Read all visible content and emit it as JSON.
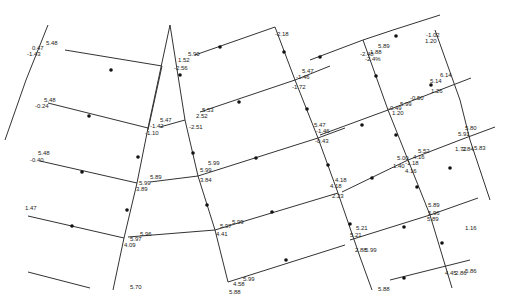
{
  "diagram": {
    "type": "pipe-network",
    "colors": {
      "line": "#333333",
      "node": "#111111",
      "background": "#ffffff"
    },
    "pipes": [
      {
        "id": "p1",
        "x1": 48,
        "y1": 25,
        "x2": 26,
        "y2": 80
      },
      {
        "id": "p2",
        "x1": 26,
        "y1": 80,
        "x2": 5,
        "y2": 140
      },
      {
        "id": "p3",
        "x1": 65,
        "y1": 50,
        "x2": 162,
        "y2": 66
      },
      {
        "id": "p4",
        "x1": 162,
        "y1": 66,
        "x2": 148,
        "y2": 130
      },
      {
        "id": "p5",
        "x1": 48,
        "y1": 103,
        "x2": 148,
        "y2": 128
      },
      {
        "id": "p6",
        "x1": 40,
        "y1": 161,
        "x2": 137,
        "y2": 183
      },
      {
        "id": "p7",
        "x1": 170,
        "y1": 25,
        "x2": 148,
        "y2": 128
      },
      {
        "id": "p8",
        "x1": 148,
        "y1": 128,
        "x2": 137,
        "y2": 183
      },
      {
        "id": "p9",
        "x1": 137,
        "y1": 183,
        "x2": 124,
        "y2": 238
      },
      {
        "id": "p10",
        "x1": 124,
        "y1": 238,
        "x2": 113,
        "y2": 290
      },
      {
        "id": "p11",
        "x1": 28,
        "y1": 216,
        "x2": 124,
        "y2": 238
      },
      {
        "id": "p12",
        "x1": 28,
        "y1": 272,
        "x2": 90,
        "y2": 288
      },
      {
        "id": "p13",
        "x1": 195,
        "y1": 55,
        "x2": 275,
        "y2": 27
      },
      {
        "id": "p14",
        "x1": 275,
        "y1": 27,
        "x2": 295,
        "y2": 80
      },
      {
        "id": "p15",
        "x1": 295,
        "y1": 80,
        "x2": 318,
        "y2": 138
      },
      {
        "id": "p16",
        "x1": 318,
        "y1": 138,
        "x2": 338,
        "y2": 193
      },
      {
        "id": "p17",
        "x1": 338,
        "y1": 193,
        "x2": 360,
        "y2": 257
      },
      {
        "id": "p18",
        "x1": 360,
        "y1": 257,
        "x2": 372,
        "y2": 290
      },
      {
        "id": "p19",
        "x1": 170,
        "y1": 25,
        "x2": 185,
        "y2": 120
      },
      {
        "id": "p20",
        "x1": 185,
        "y1": 120,
        "x2": 198,
        "y2": 176
      },
      {
        "id": "p21",
        "x1": 198,
        "y1": 176,
        "x2": 215,
        "y2": 230
      },
      {
        "id": "p22",
        "x1": 215,
        "y1": 230,
        "x2": 228,
        "y2": 282
      },
      {
        "id": "p23",
        "x1": 160,
        "y1": 127,
        "x2": 185,
        "y2": 120
      },
      {
        "id": "p24",
        "x1": 200,
        "y1": 112,
        "x2": 295,
        "y2": 80
      },
      {
        "id": "p25",
        "x1": 295,
        "y1": 80,
        "x2": 330,
        "y2": 66
      },
      {
        "id": "p26",
        "x1": 150,
        "y1": 182,
        "x2": 198,
        "y2": 176
      },
      {
        "id": "p27",
        "x1": 198,
        "y1": 176,
        "x2": 318,
        "y2": 138
      },
      {
        "id": "p28",
        "x1": 318,
        "y1": 138,
        "x2": 345,
        "y2": 128
      },
      {
        "id": "p29",
        "x1": 128,
        "y1": 237,
        "x2": 215,
        "y2": 230
      },
      {
        "id": "p30",
        "x1": 215,
        "y1": 230,
        "x2": 338,
        "y2": 193
      },
      {
        "id": "p31",
        "x1": 228,
        "y1": 282,
        "x2": 345,
        "y2": 245
      },
      {
        "id": "p32",
        "x1": 310,
        "y1": 60,
        "x2": 363,
        "y2": 40
      },
      {
        "id": "p33",
        "x1": 363,
        "y1": 40,
        "x2": 393,
        "y2": 30
      },
      {
        "id": "p34",
        "x1": 393,
        "y1": 30,
        "x2": 440,
        "y2": 15
      },
      {
        "id": "p35",
        "x1": 363,
        "y1": 40,
        "x2": 388,
        "y2": 110
      },
      {
        "id": "p36",
        "x1": 388,
        "y1": 110,
        "x2": 408,
        "y2": 160
      },
      {
        "id": "p37",
        "x1": 408,
        "y1": 160,
        "x2": 430,
        "y2": 215
      },
      {
        "id": "p38",
        "x1": 430,
        "y1": 215,
        "x2": 452,
        "y2": 288
      },
      {
        "id": "p39",
        "x1": 320,
        "y1": 135,
        "x2": 388,
        "y2": 110
      },
      {
        "id": "p40",
        "x1": 388,
        "y1": 110,
        "x2": 471,
        "y2": 78
      },
      {
        "id": "p41",
        "x1": 342,
        "y1": 192,
        "x2": 408,
        "y2": 160
      },
      {
        "id": "p42",
        "x1": 408,
        "y1": 160,
        "x2": 460,
        "y2": 140
      },
      {
        "id": "p43",
        "x1": 460,
        "y1": 140,
        "x2": 495,
        "y2": 127
      },
      {
        "id": "p44",
        "x1": 350,
        "y1": 240,
        "x2": 430,
        "y2": 215
      },
      {
        "id": "p45",
        "x1": 430,
        "y1": 215,
        "x2": 478,
        "y2": 198
      },
      {
        "id": "p46",
        "x1": 435,
        "y1": 30,
        "x2": 460,
        "y2": 100
      },
      {
        "id": "p47",
        "x1": 460,
        "y1": 100,
        "x2": 470,
        "y2": 140
      },
      {
        "id": "p48",
        "x1": 470,
        "y1": 140,
        "x2": 490,
        "y2": 200
      },
      {
        "id": "p49",
        "x1": 390,
        "y1": 280,
        "x2": 438,
        "y2": 268
      },
      {
        "id": "p50",
        "x1": 438,
        "y1": 268,
        "x2": 470,
        "y2": 260
      }
    ],
    "labels": [
      {
        "x": 46,
        "y": 40,
        "text": "5.48"
      },
      {
        "x": 32,
        "y": 45,
        "text": "0.47"
      },
      {
        "x": 27,
        "y": 51,
        "text": "-1.43"
      },
      {
        "x": 44,
        "y": 97,
        "text": "5.48"
      },
      {
        "x": 35,
        "y": 103,
        "text": "-0.24"
      },
      {
        "x": 160,
        "y": 117,
        "text": "5.47"
      },
      {
        "x": 150,
        "y": 123,
        "text": "-1.42"
      },
      {
        "x": 145,
        "y": 130,
        "text": "-1.10"
      },
      {
        "x": 38,
        "y": 150,
        "text": "5.48"
      },
      {
        "x": 30,
        "y": 157,
        "text": "-0.40"
      },
      {
        "x": 150,
        "y": 174,
        "text": "5.89"
      },
      {
        "x": 139,
        "y": 180,
        "text": "5.99"
      },
      {
        "x": 136,
        "y": 186,
        "text": "3.89"
      },
      {
        "x": 25,
        "y": 205,
        "text": "1.47"
      },
      {
        "x": 140,
        "y": 231,
        "text": "5.96"
      },
      {
        "x": 130,
        "y": 236,
        "text": "5.97"
      },
      {
        "x": 124,
        "y": 242,
        "text": "4.09"
      },
      {
        "x": 130,
        "y": 284,
        "text": "5.70"
      },
      {
        "x": 188,
        "y": 51,
        "text": "5.90"
      },
      {
        "x": 178,
        "y": 57,
        "text": "1.52"
      },
      {
        "x": 174,
        "y": 65,
        "text": "-2.56"
      },
      {
        "x": 275,
        "y": 31,
        "text": "-2.18"
      },
      {
        "x": 302,
        "y": 68,
        "text": "5.47"
      },
      {
        "x": 296,
        "y": 74,
        "text": "-1.46"
      },
      {
        "x": 292,
        "y": 84,
        "text": "-1.72"
      },
      {
        "x": 202,
        "y": 107,
        "text": "5.53"
      },
      {
        "x": 196,
        "y": 113,
        "text": "2.52"
      },
      {
        "x": 189,
        "y": 124,
        "text": "-2.51"
      },
      {
        "x": 314,
        "y": 122,
        "text": "5.47"
      },
      {
        "x": 316,
        "y": 128,
        "text": "-1.46"
      },
      {
        "x": 315,
        "y": 138,
        "text": "-0.43"
      },
      {
        "x": 208,
        "y": 160,
        "text": "5.99"
      },
      {
        "x": 200,
        "y": 167,
        "text": "5.99"
      },
      {
        "x": 200,
        "y": 177,
        "text": "3.84"
      },
      {
        "x": 335,
        "y": 177,
        "text": "4.18"
      },
      {
        "x": 330,
        "y": 183,
        "text": "4.18"
      },
      {
        "x": 332,
        "y": 193,
        "text": "2.23"
      },
      {
        "x": 232,
        "y": 219,
        "text": "5.99"
      },
      {
        "x": 220,
        "y": 223,
        "text": "5.97"
      },
      {
        "x": 216,
        "y": 231,
        "text": "4.41"
      },
      {
        "x": 243,
        "y": 276,
        "text": "5.99"
      },
      {
        "x": 233,
        "y": 281,
        "text": "4.58"
      },
      {
        "x": 229,
        "y": 289,
        "text": "5.88"
      },
      {
        "x": 378,
        "y": 43,
        "text": "5.89"
      },
      {
        "x": 370,
        "y": 49,
        "text": "1.88"
      },
      {
        "x": 360,
        "y": 51,
        "text": "-2.48"
      },
      {
        "x": 365,
        "y": 56,
        "text": "-2.4%"
      },
      {
        "x": 426,
        "y": 32,
        "text": "-1.02"
      },
      {
        "x": 425,
        "y": 38,
        "text": "1.20"
      },
      {
        "x": 440,
        "y": 72,
        "text": "6.14"
      },
      {
        "x": 430,
        "y": 78,
        "text": "5.14"
      },
      {
        "x": 431,
        "y": 88,
        "text": "1.26"
      },
      {
        "x": 410,
        "y": 95,
        "text": "-0.50"
      },
      {
        "x": 400,
        "y": 101,
        "text": "5.99"
      },
      {
        "x": 388,
        "y": 105,
        "text": "-0.49"
      },
      {
        "x": 392,
        "y": 110,
        "text": "1.20"
      },
      {
        "x": 465,
        "y": 125,
        "text": "5.80"
      },
      {
        "x": 458,
        "y": 131,
        "text": "5.91"
      },
      {
        "x": 474,
        "y": 145,
        "text": "5.83"
      },
      {
        "x": 455,
        "y": 146,
        "text": "1.72"
      },
      {
        "x": 462,
        "y": 146,
        "text": "2.84"
      },
      {
        "x": 418,
        "y": 148,
        "text": "5.52"
      },
      {
        "x": 413,
        "y": 154,
        "text": "4.16"
      },
      {
        "x": 397,
        "y": 155,
        "text": "5.00"
      },
      {
        "x": 393,
        "y": 163,
        "text": "1.40"
      },
      {
        "x": 405,
        "y": 160,
        "text": "-1.18"
      },
      {
        "x": 405,
        "y": 168,
        "text": "4.16"
      },
      {
        "x": 356,
        "y": 225,
        "text": "5.21"
      },
      {
        "x": 350,
        "y": 232,
        "text": "5.21"
      },
      {
        "x": 355,
        "y": 247,
        "text": "2.88"
      },
      {
        "x": 365,
        "y": 247,
        "text": "5.99"
      },
      {
        "x": 428,
        "y": 202,
        "text": "5.89"
      },
      {
        "x": 428,
        "y": 210,
        "text": "5.96"
      },
      {
        "x": 427,
        "y": 216,
        "text": "5.89"
      },
      {
        "x": 465,
        "y": 225,
        "text": "1.16"
      },
      {
        "x": 465,
        "y": 268,
        "text": "5.86"
      },
      {
        "x": 445,
        "y": 270,
        "text": "4.45"
      },
      {
        "x": 455,
        "y": 270,
        "text": "2.86"
      },
      {
        "x": 378,
        "y": 286,
        "text": "5.88"
      }
    ],
    "flow_arrows": [
      {
        "x": 111,
        "y": 70
      },
      {
        "x": 320,
        "y": 57
      },
      {
        "x": 89,
        "y": 116
      },
      {
        "x": 82,
        "y": 172
      },
      {
        "x": 72,
        "y": 226
      },
      {
        "x": 138,
        "y": 157
      },
      {
        "x": 127,
        "y": 210
      },
      {
        "x": 220,
        "y": 47
      },
      {
        "x": 284,
        "y": 52
      },
      {
        "x": 180,
        "y": 75
      },
      {
        "x": 193,
        "y": 153
      },
      {
        "x": 207,
        "y": 205
      },
      {
        "x": 239,
        "y": 102
      },
      {
        "x": 256,
        "y": 158
      },
      {
        "x": 272,
        "y": 212
      },
      {
        "x": 286,
        "y": 260
      },
      {
        "x": 307,
        "y": 109
      },
      {
        "x": 328,
        "y": 165
      },
      {
        "x": 350,
        "y": 224
      },
      {
        "x": 396,
        "y": 36
      },
      {
        "x": 376,
        "y": 76
      },
      {
        "x": 396,
        "y": 135
      },
      {
        "x": 417,
        "y": 187
      },
      {
        "x": 442,
        "y": 243
      },
      {
        "x": 431,
        "y": 85
      },
      {
        "x": 450,
        "y": 168
      },
      {
        "x": 362,
        "y": 125
      },
      {
        "x": 372,
        "y": 178
      },
      {
        "x": 404,
        "y": 227
      },
      {
        "x": 404,
        "y": 278
      }
    ]
  }
}
